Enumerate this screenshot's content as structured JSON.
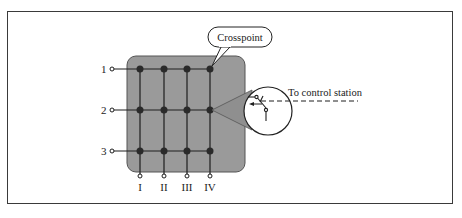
{
  "diagram": {
    "callout_label": "Crosspoint",
    "control_label": "To control station",
    "row_labels": [
      "1",
      "2",
      "3"
    ],
    "column_labels": [
      "I",
      "II",
      "III",
      "IV"
    ],
    "colors": {
      "matrix_fill": "#9a9a9a",
      "lines": "#1e1e1e",
      "frame": "#3a3a3a"
    }
  }
}
